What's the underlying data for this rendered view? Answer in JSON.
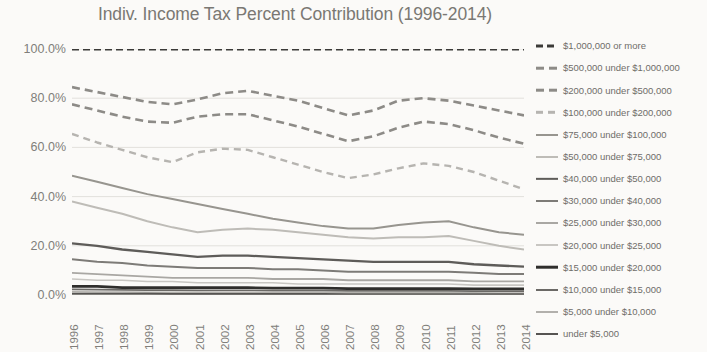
{
  "chart_data": {
    "type": "line",
    "title": "Indiv. Income Tax Percent Contribution (1996-2014)",
    "xlabel": "",
    "ylabel": "",
    "ylim": [
      0,
      100
    ],
    "ytick_labels": [
      "0.0%",
      "20.0%",
      "40.0%",
      "60.0%",
      "80.0%",
      "100.0%"
    ],
    "ytick_values": [
      0,
      20,
      40,
      60,
      80,
      100
    ],
    "grid": true,
    "legend_position": "right",
    "categories": [
      "1996",
      "1997",
      "1998",
      "1999",
      "2000",
      "2001",
      "2002",
      "2003",
      "2004",
      "2005",
      "2006",
      "2007",
      "2008",
      "2009",
      "2010",
      "2011",
      "2012",
      "2013",
      "2014"
    ],
    "series": [
      {
        "name": "$1,000,000 or more",
        "style": "dashed",
        "color": "#3b3a38",
        "width": 3.0,
        "dash": "7,4",
        "values": [
          100,
          100,
          100,
          100,
          100,
          100,
          100,
          100,
          100,
          100,
          100,
          100,
          100,
          100,
          100,
          100,
          100,
          100,
          100
        ]
      },
      {
        "name": "$500,000 under $1,000,000",
        "style": "dashed",
        "color": "#8d8b87",
        "width": 2.6,
        "dash": "8,5",
        "values": [
          84.5,
          82.5,
          80.5,
          78.5,
          77.5,
          79.5,
          82.0,
          83.0,
          81.0,
          79.0,
          76.0,
          73.0,
          75.0,
          79.0,
          80.0,
          79.0,
          77.0,
          75.0,
          73.0
        ]
      },
      {
        "name": "$200,000 under $500,000",
        "style": "dashed",
        "color": "#8d8b87",
        "width": 2.6,
        "dash": "8,5",
        "values": [
          77.5,
          75.0,
          72.5,
          70.5,
          70.0,
          72.5,
          73.5,
          73.5,
          71.0,
          68.5,
          65.5,
          62.5,
          64.5,
          68.0,
          70.5,
          69.5,
          67.0,
          64.0,
          61.5
        ]
      },
      {
        "name": "$100,000 under $200,000",
        "style": "dashed",
        "color": "#b6b4b0",
        "width": 2.4,
        "dash": "7,5",
        "values": [
          65.5,
          62.0,
          59.0,
          56.0,
          54.0,
          58.0,
          59.5,
          59.0,
          56.0,
          53.0,
          50.0,
          47.5,
          49.0,
          51.5,
          53.5,
          52.5,
          50.0,
          46.5,
          43.0
        ]
      },
      {
        "name": "$75,000 under $100,000",
        "style": "solid",
        "color": "#97958f",
        "width": 2.0,
        "dash": "",
        "values": [
          48.5,
          46.0,
          43.5,
          41.0,
          39.0,
          37.0,
          35.0,
          33.0,
          31.0,
          29.5,
          28.0,
          27.0,
          27.0,
          28.5,
          29.5,
          30.0,
          27.5,
          25.5,
          24.5
        ]
      },
      {
        "name": "$50,000 under $75,000",
        "style": "solid",
        "color": "#bebcb7",
        "width": 2.0,
        "dash": "",
        "values": [
          38.0,
          35.5,
          33.0,
          30.0,
          27.5,
          25.5,
          26.5,
          27.0,
          26.5,
          25.5,
          24.5,
          23.5,
          23.0,
          23.5,
          23.5,
          24.0,
          22.0,
          20.0,
          18.5
        ]
      },
      {
        "name": "$40,000 under $50,000",
        "style": "solid",
        "color": "#5e5c59",
        "width": 2.3,
        "dash": "",
        "values": [
          21.0,
          20.0,
          18.5,
          17.5,
          16.5,
          15.5,
          16.0,
          16.0,
          15.5,
          15.0,
          14.5,
          14.0,
          13.5,
          13.5,
          13.5,
          13.5,
          12.5,
          12.0,
          11.5
        ]
      },
      {
        "name": "$30,000 under $40,000",
        "style": "solid",
        "color": "#7d7b77",
        "width": 2.0,
        "dash": "",
        "values": [
          14.5,
          13.5,
          13.0,
          12.0,
          11.5,
          11.0,
          11.0,
          11.0,
          10.5,
          10.5,
          10.0,
          9.5,
          9.5,
          9.5,
          9.5,
          9.5,
          9.0,
          8.5,
          8.5
        ]
      },
      {
        "name": "$25,000 under $30,000",
        "style": "solid",
        "color": "#a9a7a3",
        "width": 1.8,
        "dash": "",
        "values": [
          9.0,
          8.5,
          8.0,
          7.5,
          7.0,
          7.0,
          7.0,
          7.0,
          6.5,
          6.5,
          6.5,
          6.0,
          6.0,
          6.0,
          6.0,
          6.0,
          5.5,
          5.5,
          5.5
        ]
      },
      {
        "name": "$20,000 under $25,000",
        "style": "solid",
        "color": "#c8c6c2",
        "width": 1.6,
        "dash": "",
        "values": [
          6.5,
          6.0,
          6.0,
          5.5,
          5.5,
          5.0,
          5.0,
          5.0,
          5.0,
          4.5,
          4.5,
          4.5,
          4.5,
          4.5,
          4.5,
          4.5,
          4.0,
          4.0,
          4.0
        ]
      },
      {
        "name": "$15,000 under $20,000",
        "style": "solid",
        "color": "#2f2e2c",
        "width": 2.6,
        "dash": "",
        "values": [
          3.5,
          3.5,
          3.0,
          3.0,
          3.0,
          3.0,
          3.0,
          3.0,
          2.8,
          2.8,
          2.8,
          2.6,
          2.6,
          2.6,
          2.6,
          2.6,
          2.5,
          2.5,
          2.5
        ]
      },
      {
        "name": "$10,000 under $15,000",
        "style": "solid",
        "color": "#6b6966",
        "width": 1.7,
        "dash": "",
        "values": [
          2.3,
          2.2,
          2.1,
          2.0,
          2.0,
          1.9,
          1.9,
          1.9,
          1.8,
          1.8,
          1.8,
          1.7,
          1.7,
          1.7,
          1.7,
          1.7,
          1.6,
          1.6,
          1.6
        ]
      },
      {
        "name": "$5,000 under $10,000",
        "style": "solid",
        "color": "#b2b0ac",
        "width": 1.5,
        "dash": "",
        "values": [
          1.3,
          1.2,
          1.2,
          1.1,
          1.1,
          1.1,
          1.0,
          1.0,
          1.0,
          1.0,
          1.0,
          0.9,
          0.9,
          0.9,
          0.9,
          0.9,
          0.9,
          0.8,
          0.8
        ]
      },
      {
        "name": "under $5,000",
        "style": "solid",
        "color": "#565452",
        "width": 1.8,
        "dash": "",
        "values": [
          0.5,
          0.5,
          0.5,
          0.5,
          0.4,
          0.4,
          0.4,
          0.4,
          0.4,
          0.4,
          0.4,
          0.3,
          0.3,
          0.3,
          0.3,
          0.3,
          0.3,
          0.3,
          0.3
        ]
      }
    ]
  }
}
